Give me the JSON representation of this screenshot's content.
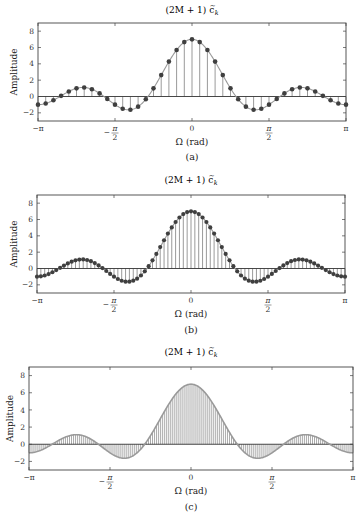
{
  "figure": {
    "panels": [
      {
        "id": "a",
        "title": "(2M + 1) c̃k",
        "title_main": "(2M + 1) c",
        "title_sub": "k",
        "caption": "(a)",
        "xlabel": "Ω (rad)",
        "ylabel": "Amplitude",
        "style": "stem-markers",
        "samples": 41
      },
      {
        "id": "b",
        "title": "(2M + 1) c̃k",
        "title_main": "(2M + 1) c",
        "title_sub": "k",
        "caption": "(b)",
        "xlabel": "Ω (rad)",
        "ylabel": "Amplitude",
        "style": "stem-markers",
        "samples": 81
      },
      {
        "id": "c",
        "title": "(2M + 1) c̃k",
        "title_main": "(2M + 1) c",
        "title_sub": "k",
        "caption": "(c)",
        "xlabel": "Ω (rad)",
        "ylabel": "Amplitude",
        "style": "stem-dense",
        "samples": 161
      }
    ],
    "xticks": [
      "−π",
      "−π/2",
      "0",
      "π/2",
      "π"
    ],
    "yticks": [
      "−2",
      "0",
      "2",
      "4",
      "6",
      "8"
    ],
    "colors": {
      "curve": "#9a9a9a",
      "stem": "#6e6e6e",
      "marker": "#3f3f3f",
      "axis": "#444444"
    }
  },
  "chart_data": [
    {
      "type": "line",
      "title": "(2M + 1) c̃_k",
      "subtitle": "(a)",
      "xlabel": "Ω (rad)",
      "ylabel": "Amplitude",
      "xlim": [
        -3.1416,
        3.1416
      ],
      "ylim": [
        -3,
        9
      ],
      "xtick_labels": [
        "-π",
        "-π/2",
        "0",
        "π/2",
        "π"
      ],
      "ytick_labels": [
        -2,
        0,
        2,
        4,
        6,
        8
      ],
      "grid": false,
      "series": [
        {
          "name": "Dirichlet kernel sin(7Ω/2)/sin(Ω/2), M=3, 41 stem samples",
          "peak": 7,
          "min": -1.6,
          "side_lobe_max": 1.1,
          "value_at_pi": -1,
          "zeros": [
            -2.693,
            -1.795,
            -0.898,
            0.898,
            1.795,
            2.693
          ]
        }
      ]
    },
    {
      "type": "line",
      "title": "(2M + 1) c̃_k",
      "subtitle": "(b)",
      "xlabel": "Ω (rad)",
      "ylabel": "Amplitude",
      "xlim": [
        -3.1416,
        3.1416
      ],
      "ylim": [
        -3,
        9
      ],
      "xtick_labels": [
        "-π",
        "-π/2",
        "0",
        "π/2",
        "π"
      ],
      "ytick_labels": [
        -2,
        0,
        2,
        4,
        6,
        8
      ],
      "grid": false,
      "series": [
        {
          "name": "Dirichlet kernel, M=3, 81 stem samples",
          "peak": 7,
          "min": -1.6,
          "side_lobe_max": 1.1,
          "value_at_pi": -1
        }
      ]
    },
    {
      "type": "line",
      "title": "(2M + 1) c̃_k",
      "subtitle": "(c)",
      "xlabel": "Ω (rad)",
      "ylabel": "Amplitude",
      "xlim": [
        -3.1416,
        3.1416
      ],
      "ylim": [
        -3,
        9
      ],
      "xtick_labels": [
        "-π",
        "-π/2",
        "0",
        "π/2",
        "π"
      ],
      "ytick_labels": [
        -2,
        0,
        2,
        4,
        6,
        8
      ],
      "grid": false,
      "series": [
        {
          "name": "Dirichlet kernel, M=3, 161 dense stems (no markers)",
          "peak": 7,
          "min": -1.6,
          "side_lobe_max": 1.1,
          "value_at_pi": -1
        }
      ]
    }
  ]
}
